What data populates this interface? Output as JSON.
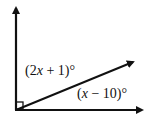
{
  "diagram": {
    "type": "angle-diagram",
    "right_angle_marker": true,
    "rays": [
      "vertical-up",
      "diagonal",
      "horizontal-right"
    ],
    "labels": {
      "upper_angle": {
        "prefix": "(2",
        "var": "x",
        "suffix": " + 1)°"
      },
      "lower_angle": {
        "prefix": "(",
        "var": "x",
        "suffix": " − 10)°"
      }
    },
    "line_color": "#111111"
  }
}
